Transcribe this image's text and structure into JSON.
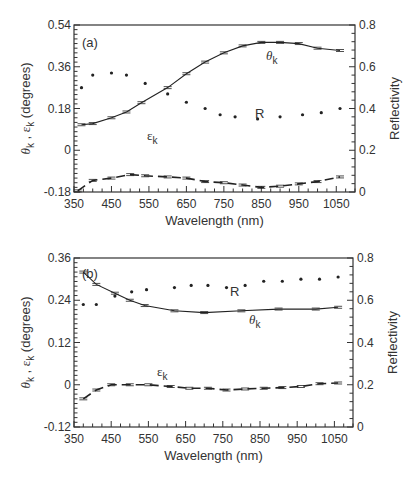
{
  "chart_data": [
    {
      "type": "line",
      "panel": "(a)",
      "xlabel": "Wavelength  (nm)",
      "ylabel": "θk , εk  (degrees)",
      "ylabel_right": "Reflectivity",
      "xlim": [
        350,
        1100
      ],
      "ylim": [
        -0.18,
        0.54
      ],
      "ylim_right": [
        0,
        0.8
      ],
      "x_ticks": [
        350,
        450,
        550,
        650,
        750,
        850,
        950,
        1050
      ],
      "y_ticks": [
        "-0.18",
        "0",
        "0.18",
        "0.36",
        "0.54"
      ],
      "y_ticks_right": [
        "0",
        "0.2",
        "0.4",
        "0.6",
        "0.8"
      ],
      "grid": false,
      "series": [
        {
          "name": "θk",
          "style": "solid line with error bars",
          "axis": "left",
          "x": [
            370,
            400,
            450,
            490,
            530,
            600,
            650,
            700,
            750,
            800,
            850,
            900,
            950,
            1000,
            1060
          ],
          "values": [
            0.11,
            0.115,
            0.14,
            0.165,
            0.205,
            0.27,
            0.33,
            0.38,
            0.42,
            0.45,
            0.465,
            0.465,
            0.46,
            0.44,
            0.43
          ]
        },
        {
          "name": "R",
          "style": "dots",
          "axis": "right",
          "x": [
            370,
            400,
            450,
            490,
            540,
            600,
            650,
            700,
            740,
            780,
            840,
            900,
            960,
            1010,
            1060
          ],
          "values": [
            0.5,
            0.56,
            0.57,
            0.56,
            0.52,
            0.47,
            0.43,
            0.4,
            0.37,
            0.36,
            0.35,
            0.36,
            0.37,
            0.38,
            0.4
          ]
        },
        {
          "name": "εk",
          "style": "dashed line with error bars",
          "axis": "left",
          "x": [
            360,
            400,
            450,
            500,
            540,
            600,
            650,
            700,
            750,
            800,
            850,
            900,
            950,
            1000,
            1060
          ],
          "values": [
            -0.175,
            -0.13,
            -0.12,
            -0.105,
            -0.11,
            -0.115,
            -0.12,
            -0.135,
            -0.14,
            -0.15,
            -0.16,
            -0.155,
            -0.145,
            -0.135,
            -0.115
          ]
        }
      ],
      "annotations": [
        "(a)",
        "θk",
        "R",
        "εk"
      ]
    },
    {
      "type": "line",
      "panel": "(b)",
      "xlabel": "Wavelength  (nm)",
      "ylabel": "θk , εk  (degrees)",
      "ylabel_right": "Reflectivity",
      "xlim": [
        350,
        1100
      ],
      "ylim": [
        -0.12,
        0.36
      ],
      "ylim_right": [
        0,
        0.8
      ],
      "x_ticks": [
        350,
        450,
        550,
        650,
        750,
        850,
        950,
        1050
      ],
      "y_ticks": [
        "-0.12",
        "0",
        "0.12",
        "0.24",
        "0.36"
      ],
      "y_ticks_right": [
        "0",
        "0.2",
        "0.4",
        "0.6",
        "0.8"
      ],
      "grid": false,
      "series": [
        {
          "name": "θk",
          "style": "solid line with error bars",
          "axis": "left",
          "x": [
            375,
            410,
            460,
            500,
            540,
            620,
            700,
            800,
            900,
            1000,
            1060
          ],
          "values": [
            0.32,
            0.285,
            0.26,
            0.24,
            0.225,
            0.21,
            0.205,
            0.21,
            0.215,
            0.215,
            0.22
          ]
        },
        {
          "name": "R",
          "style": "dots",
          "axis": "right",
          "x": [
            375,
            410,
            460,
            505,
            545,
            620,
            665,
            710,
            760,
            810,
            860,
            910,
            960,
            1010,
            1060
          ],
          "values": [
            0.58,
            0.58,
            0.62,
            0.64,
            0.65,
            0.66,
            0.67,
            0.67,
            0.66,
            0.67,
            0.69,
            0.69,
            0.7,
            0.7,
            0.71
          ]
        },
        {
          "name": "εk",
          "style": "dashed line with error bars",
          "axis": "left",
          "x": [
            375,
            410,
            450,
            500,
            550,
            610,
            660,
            710,
            760,
            810,
            860,
            910,
            960,
            1010,
            1060
          ],
          "values": [
            -0.04,
            -0.015,
            0.0,
            0.0,
            0.0,
            -0.005,
            -0.01,
            -0.01,
            -0.015,
            -0.012,
            -0.01,
            -0.008,
            -0.005,
            0.003,
            0.005
          ]
        }
      ],
      "annotations": [
        "(b)",
        "R",
        "θk",
        "εk"
      ]
    }
  ],
  "labels": {
    "a_panel": "(a)",
    "b_panel": "(b)",
    "theta": "θ",
    "epsilon": "ε",
    "sub_k": "k",
    "r_label": "R",
    "xlabel": "Wavelength  (nm)",
    "ylabel_right": "Reflectivity"
  }
}
